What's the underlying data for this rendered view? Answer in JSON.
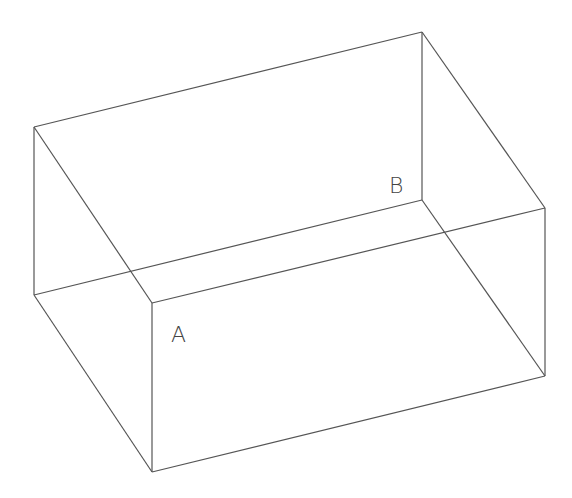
{
  "diagram": {
    "type": "rectangular-box-wireframe",
    "stroke_color": "#555555",
    "background": "#ffffff",
    "vertices": {
      "back_top_left": [
        34,
        127
      ],
      "back_top_right": [
        422,
        32
      ],
      "back_bottom_right": [
        422,
        200
      ],
      "back_bottom_left": [
        34,
        295
      ],
      "front_top_left": [
        152,
        303
      ],
      "front_top_right": [
        545,
        208
      ],
      "front_bottom_right": [
        545,
        376
      ],
      "front_bottom_left": [
        152,
        472
      ]
    },
    "labels": {
      "A": "A",
      "B": "B"
    }
  }
}
